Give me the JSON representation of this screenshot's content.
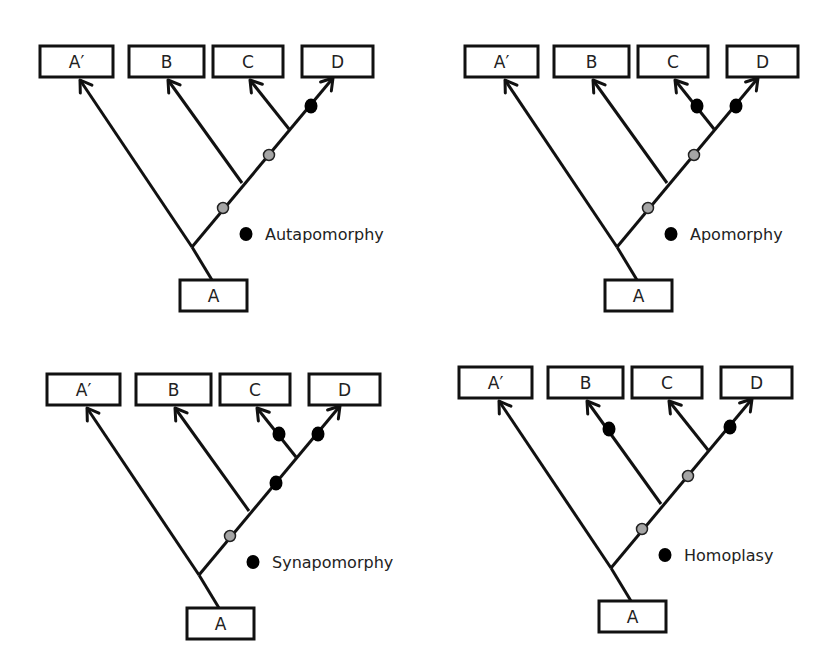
{
  "figure": {
    "panels": [
      {
        "title": "Autapomorphy",
        "origin": [
          40,
          46
        ],
        "legend_label": "Autapomorphy",
        "black_marks": [
          "D"
        ],
        "gray_marks": [
          "AB_stem",
          "BCD_stem"
        ]
      },
      {
        "title": "Apomorphy",
        "origin": [
          465,
          46
        ],
        "legend_label": "Apomorphy",
        "black_marks": [
          "C",
          "D"
        ],
        "gray_marks": [
          "AB_stem",
          "BCD_stem"
        ]
      },
      {
        "title": "Synapomorphy",
        "origin": [
          47,
          374
        ],
        "legend_label": "Synapomorphy",
        "black_marks": [
          "C",
          "D",
          "CD_stem"
        ],
        "gray_marks": [
          "AB_stem"
        ]
      },
      {
        "title": "Homoplasy",
        "origin": [
          459,
          367
        ],
        "legend_label": "Homoplasy",
        "black_marks": [
          "B",
          "D"
        ],
        "gray_marks": [
          "AB_stem",
          "BCD_stem"
        ]
      }
    ],
    "taxa": [
      "A′",
      "B",
      "C",
      "D"
    ],
    "root_label": "A",
    "colors": {
      "line": "#111111",
      "derived_marker": "#000000",
      "ancestral_marker": "#a5a5a5",
      "background": "#ffffff"
    }
  }
}
